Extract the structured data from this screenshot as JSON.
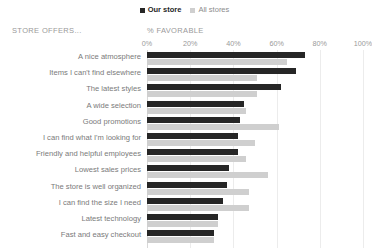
{
  "legend": {
    "entries": [
      {
        "label": "Our store",
        "color": "#262626",
        "key": "our_store"
      },
      {
        "label": "All stores",
        "color": "#cfcfcf",
        "key": "all_stores"
      }
    ]
  },
  "headers": {
    "category_header": "STORE OFFERS...",
    "value_header": "% FAVORABLE"
  },
  "chart_data": {
    "type": "bar",
    "orientation": "horizontal",
    "title": "",
    "subtitle": "",
    "xlabel": "% FAVORABLE",
    "ylabel": "STORE OFFERS...",
    "xlim": [
      0,
      100
    ],
    "tick_labels": [
      "0%",
      "20%",
      "40%",
      "60%",
      "80%",
      "100%"
    ],
    "tick_values": [
      0,
      20,
      40,
      60,
      80,
      100
    ],
    "grid": true,
    "legend_position": "top-center",
    "categories": [
      "A nice atmosphere",
      "Items I can't find elsewhere",
      "The latest styles",
      "A wide selection",
      "Good promotions",
      "I can find what I'm looking for",
      "Friendly and helpful employees",
      "Lowest sales prices",
      "The store is well organized",
      "I can find the size I need",
      "Latest technology",
      "Fast and easy checkout"
    ],
    "series": [
      {
        "name": "Our store",
        "color": "#262626",
        "values": [
          73,
          69,
          62,
          45,
          43,
          42,
          42,
          38,
          37,
          35,
          33,
          31
        ]
      },
      {
        "name": "All stores",
        "color": "#cfcfcf",
        "values": [
          65,
          51,
          51,
          46,
          61,
          50,
          46,
          56,
          47,
          47,
          33,
          31
        ]
      }
    ]
  }
}
